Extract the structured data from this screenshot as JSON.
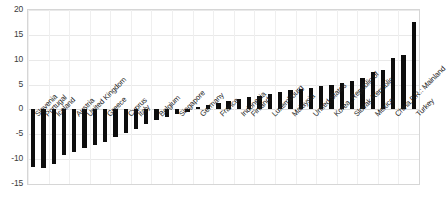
{
  "chart_data": {
    "type": "bar",
    "title": "",
    "subtitle": "",
    "xlabel": "",
    "ylabel": "",
    "ylim": [
      -15,
      20
    ],
    "yticks": [
      20,
      15,
      10,
      5,
      0,
      -5,
      -10,
      -15
    ],
    "ytick_labels": [
      "20",
      "15",
      "10",
      "5",
      "0",
      "-5",
      "-10",
      "-15"
    ],
    "grid": true,
    "legend": "none",
    "orientation": "vertical",
    "bar_color": "#0d0d0d",
    "categories": [
      "Slovenia",
      "Portugal",
      "Iceland",
      "Korea",
      "Austria",
      "United Kingdom",
      "Spain",
      "Greece",
      "Netherlands",
      "Cyprus",
      "Italy",
      "Denmark",
      "Belgium",
      "Japan",
      "Singapore",
      "Sweden",
      "Germany",
      "Norway",
      "France",
      "Ireland",
      "Indonesia",
      "Finland",
      "Canada",
      "Luxembourg",
      "Australia",
      "Malaysia",
      "Switzerland",
      "United States",
      "Israel",
      "Korea, Republic of",
      "Hungary",
      "Slovak Republic",
      "Poland",
      "Mexico",
      "Chile",
      "China,P.R.: Mainland",
      "Brazil",
      "Turkey"
    ],
    "values": [
      -11.5,
      -11.8,
      -11.0,
      -9.2,
      -8.5,
      -7.8,
      -7.2,
      -6.5,
      -5.6,
      -4.8,
      -3.9,
      -3.0,
      -2.2,
      -1.5,
      -1.0,
      -0.6,
      0.4,
      0.8,
      1.2,
      1.6,
      2.0,
      2.4,
      2.8,
      3.2,
      3.6,
      3.9,
      4.2,
      4.4,
      4.7,
      5.0,
      5.4,
      5.8,
      6.4,
      7.6,
      8.0,
      10.4,
      11.0,
      17.5
    ],
    "visible_tick_labels": [
      "Slovenia",
      "Portugal",
      "Iceland",
      "Austria",
      "United Kingdom",
      "Greece",
      "Cyprus",
      "Italy",
      "Belgium",
      "Singapore",
      "Germany",
      "France",
      "Finland",
      "Indonesia",
      "Luxembourg",
      "Malaysia",
      "United States",
      "Korea, Republic of",
      "Slovak Republic",
      "Mexico",
      "China,P.R.: Mainland",
      "Turkey"
    ]
  }
}
